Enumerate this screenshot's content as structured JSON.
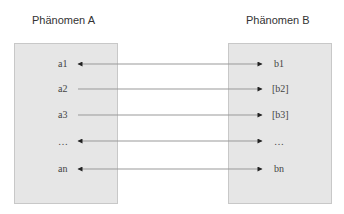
{
  "diagram": {
    "left_title": "Phänomen A",
    "right_title": "Phänomen B",
    "rows": [
      {
        "a": "a1",
        "b": "b1",
        "direction": "both"
      },
      {
        "a": "a2",
        "b": "[b2]",
        "direction": "right"
      },
      {
        "a": "a3",
        "b": "[b3]",
        "direction": "right"
      },
      {
        "a": "…",
        "b": "…",
        "direction": "both"
      },
      {
        "a": "an",
        "b": "bn",
        "direction": "both"
      }
    ],
    "colors": {
      "box_fill": "#e6e6e6",
      "box_border": "#c8c8c8",
      "line": "#999999",
      "arrowhead": "#222222"
    }
  }
}
